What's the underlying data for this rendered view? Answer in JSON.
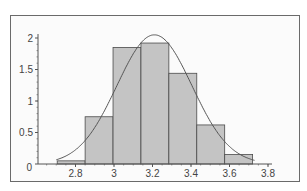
{
  "chart_data": {
    "type": "bar",
    "subtype": "histogram-with-normal-curve",
    "title": "",
    "xlabel": "",
    "ylabel": "",
    "xlim": [
      2.6,
      3.8
    ],
    "ylim": [
      0,
      2
    ],
    "x_ticks": [
      "2.8",
      "3",
      "3.2",
      "3.4",
      "3.6",
      "3.8"
    ],
    "y_ticks": [
      "0",
      "0.5",
      "1",
      "1.5",
      "2"
    ],
    "bins": {
      "edges": [
        2.705,
        2.85,
        2.995,
        3.14,
        3.285,
        3.43,
        3.575,
        3.72
      ],
      "values": [
        0.05,
        0.75,
        1.85,
        1.92,
        1.44,
        0.62,
        0.15
      ]
    },
    "series": [
      {
        "name": "histogram",
        "type": "bar",
        "values": [
          0.05,
          0.75,
          1.85,
          1.92,
          1.44,
          0.62,
          0.15
        ]
      },
      {
        "name": "normal density fit",
        "type": "line",
        "mean": 3.21,
        "sd": 0.195,
        "peak": 2.05
      }
    ],
    "grid": false,
    "legend": null,
    "colors": {
      "bar_fill": "#c4c4c4",
      "bar_stroke": "#4a4a4a",
      "curve": "#555555",
      "axis": "#555555"
    }
  }
}
